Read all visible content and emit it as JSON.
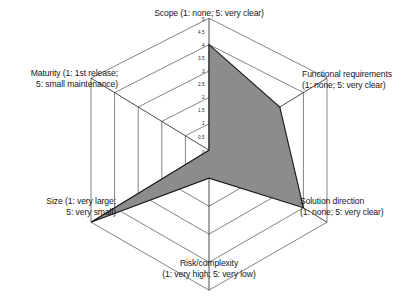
{
  "chart_data": {
    "type": "radar",
    "title": "",
    "categories": [
      "Scope (1: none; 5: very clear)",
      "Functional requirements (1: none; 5: very clear)",
      "Solution direction (1: none; 5: very clear)",
      "Risk/complexity (1: very high; 5: very low)",
      "Size (1: very large; 5: very small)",
      "Maturity (1: 1st release; 5: small maintenance)"
    ],
    "values": [
      4,
      3,
      4,
      1,
      5,
      0
    ],
    "rlim": [
      0,
      5
    ],
    "tick_values": [
      "5",
      "4.5",
      "4",
      "3.5",
      "3",
      "2.5",
      "2",
      "1.5",
      "1",
      "0.5",
      "0"
    ],
    "grid": true,
    "legend": "none",
    "series": [
      {
        "name": "Project profile",
        "values": [
          4,
          3,
          4,
          1,
          5,
          0
        ]
      }
    ],
    "fill_color": "#8c8c8c",
    "line_color": "#1a1a1a",
    "grid_color": "#4d4d4d",
    "background": "#ffffff"
  },
  "axis_labels": {
    "scope": {
      "line1": "Scope (1: none; 5: very clear)"
    },
    "functional": {
      "line1": "Functional requirements",
      "line2": "(1: none; 5: very clear)"
    },
    "solution": {
      "line1": "Solution direction",
      "line2": "(1: none; 5: very clear)"
    },
    "risk": {
      "line1": "Risk/complexity",
      "line2": "(1: very high; 5: very low)"
    },
    "size": {
      "line1": "Size (1: very large;",
      "line2": "5: very small)"
    },
    "maturity": {
      "line1": "Maturity (1: 1st release;",
      "line2": "5: small maintenance)"
    }
  },
  "ticks": {
    "t0": "5",
    "t1": "4.5",
    "t2": "4",
    "t3": "3.5",
    "t4": "3",
    "t5": "2.5",
    "t6": "2",
    "t7": "1.5",
    "t8": "1",
    "t9": "0.5",
    "t10": "0"
  }
}
